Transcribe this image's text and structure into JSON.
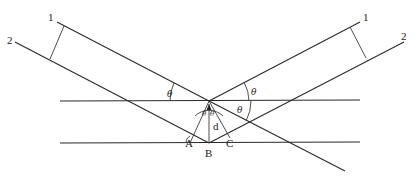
{
  "diagram": {
    "type": "bragg-diffraction",
    "ray_labels": {
      "incident_1": "1",
      "incident_2": "2",
      "reflected_1": "1",
      "reflected_2": "2"
    },
    "angle_symbol": "θ",
    "angle_labels": [
      "θ",
      "θ",
      "θ",
      "θ",
      "θ"
    ],
    "points": {
      "A": "A",
      "B": "B",
      "C": "C"
    },
    "spacing_label": "d",
    "planes": 2
  }
}
